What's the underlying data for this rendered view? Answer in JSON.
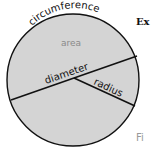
{
  "diagram": {
    "labels": {
      "circumference": "circumference",
      "area": "area",
      "diameter": "diameter",
      "radius": "radius"
    },
    "colors": {
      "fill": "#d4d4d4",
      "stroke": "#111111",
      "area_text": "#8a8a8a"
    }
  },
  "side_text": {
    "top": "Ex",
    "bottom": "Fi"
  }
}
